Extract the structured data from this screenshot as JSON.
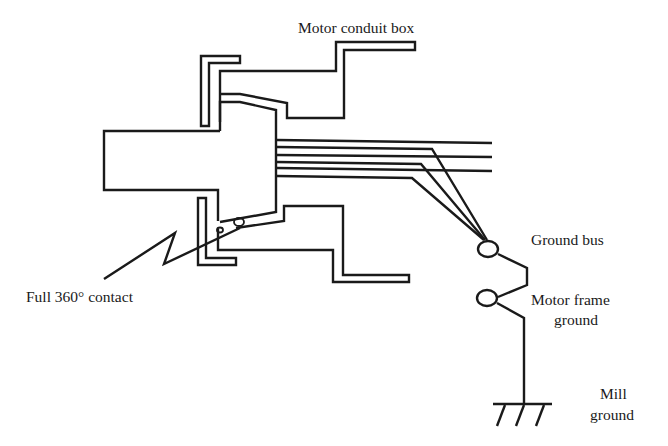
{
  "figure": {
    "type": "technical-diagram",
    "background": "#ffffff",
    "line_color": "#1a1a1a"
  },
  "labels": {
    "motor_conduit_box": "Motor conduit box",
    "full_contact": "Full 360° contact",
    "ground_bus": "Ground bus",
    "motor_frame_ground_line1": "Motor frame",
    "motor_frame_ground_line2": "ground",
    "mill_ground_line1": "Mill",
    "mill_ground_line2": "ground"
  },
  "components": [
    {
      "name": "motor-shaft-housing",
      "description": "Rectangular motor body extension on left"
    },
    {
      "name": "upper-bracket",
      "description": "Upper L-shaped conduit fitting bracket"
    },
    {
      "name": "lower-bracket",
      "description": "Lower L-shaped conduit fitting bracket"
    },
    {
      "name": "conduit-box",
      "description": "Stepped motor conduit box outline"
    },
    {
      "name": "conductors",
      "count": 6,
      "description": "Conductors leaving the motor; three pass through, three bend to ground bus"
    },
    {
      "name": "ground-bus",
      "description": "Ground bus terminal (circle)"
    },
    {
      "name": "motor-frame-ground",
      "description": "Motor frame ground terminal (circle)"
    },
    {
      "name": "mill-ground",
      "description": "Earth ground symbol"
    }
  ]
}
